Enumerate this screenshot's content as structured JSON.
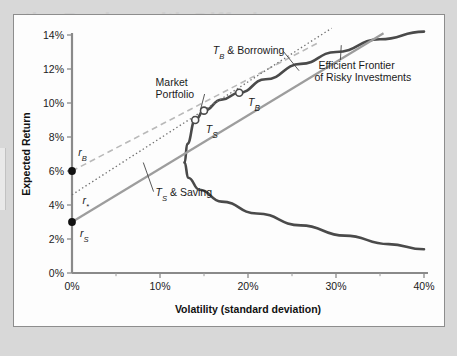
{
  "figure": {
    "background_color": "#fdfdfd",
    "page_background": "#d8d8d8",
    "border_color": "#8d8d8d",
    "ghost_text": {
      "title": "the Banker with Differing",
      "line1": "Volatility problem and",
      "line2": "a possible solution"
    }
  },
  "chart_data": {
    "type": "line",
    "title": "",
    "xlabel": "Volatility (standard deviation)",
    "ylabel": "Expected Return",
    "xlim": [
      0,
      40
    ],
    "ylim": [
      0,
      14
    ],
    "grid": false,
    "legend_position": "inline-annotations",
    "xticks": [
      0,
      10,
      20,
      30,
      40
    ],
    "xtick_labels": [
      "0%",
      "10%",
      "20%",
      "30%",
      "40%"
    ],
    "yticks": [
      0,
      2,
      4,
      6,
      8,
      10,
      12,
      14
    ],
    "ytick_labels": [
      "0%",
      "2%",
      "4%",
      "6%",
      "8%",
      "10%",
      "12%",
      "14%"
    ],
    "series": [
      {
        "name": "Efficient Frontier of Risky Investments",
        "style": "solid",
        "color": "#4a4a4a",
        "width": 2.6,
        "note": "hyperbola; upper efficient branch and lower inefficient branch",
        "min_variance_point": {
          "x": 12.8,
          "y": 6.5
        },
        "points_upper": [
          {
            "x": 12.8,
            "y": 6.5
          },
          {
            "x": 13.1,
            "y": 7.6
          },
          {
            "x": 14.0,
            "y": 9.0
          },
          {
            "x": 15.0,
            "y": 9.55
          },
          {
            "x": 17.0,
            "y": 10.2
          },
          {
            "x": 19.0,
            "y": 10.6
          },
          {
            "x": 22.0,
            "y": 11.4
          },
          {
            "x": 26.0,
            "y": 12.3
          },
          {
            "x": 30.0,
            "y": 13.0
          },
          {
            "x": 35.0,
            "y": 13.75
          },
          {
            "x": 40.0,
            "y": 14.2
          }
        ],
        "points_lower": [
          {
            "x": 12.8,
            "y": 6.5
          },
          {
            "x": 13.2,
            "y": 5.6
          },
          {
            "x": 14.5,
            "y": 4.9
          },
          {
            "x": 17.0,
            "y": 4.2
          },
          {
            "x": 21.0,
            "y": 3.5
          },
          {
            "x": 26.0,
            "y": 2.8
          },
          {
            "x": 31.0,
            "y": 2.2
          },
          {
            "x": 36.0,
            "y": 1.7
          },
          {
            "x": 40.0,
            "y": 1.4
          }
        ]
      },
      {
        "name": "T_B & Borrowing",
        "style": "dashed",
        "color": "#b9b9b9",
        "width": 1.6,
        "intercept": {
          "x": 0,
          "y": 6.0
        },
        "tangency": {
          "x": 19.0,
          "y": 10.6
        },
        "end": {
          "x": 28.2,
          "y": 13.6
        },
        "slope_per_pct_vol": 0.242
      },
      {
        "name": "T_S & Saving",
        "style": "solid",
        "color": "#9d9d9d",
        "width": 2.2,
        "intercept": {
          "x": 0,
          "y": 3.0
        },
        "tangency": {
          "x": 14.0,
          "y": 9.0
        },
        "end": {
          "x": 35.4,
          "y": 14.1
        },
        "slope_per_pct_vol": 0.4286
      },
      {
        "name": "r* tangent through Market Portfolio",
        "style": "dotted",
        "color": "#6f6f6f",
        "width": 1.3,
        "intercept": {
          "x": 0,
          "y": 4.6
        },
        "tangency": {
          "x": 15.0,
          "y": 9.55
        },
        "end": {
          "x": 29.5,
          "y": 14.4
        },
        "slope_per_pct_vol": 0.33
      }
    ],
    "points": [
      {
        "label": "r_B",
        "x": 0,
        "y": 6.0,
        "marker": "filled-circle",
        "color": "#111111"
      },
      {
        "label": "r_S",
        "x": 0,
        "y": 3.0,
        "marker": "filled-circle",
        "color": "#111111"
      },
      {
        "label": "T_S",
        "x": 14.0,
        "y": 9.0,
        "marker": "open-circle",
        "color": "#4a4a4a"
      },
      {
        "label": "Market Portfolio",
        "x": 15.0,
        "y": 9.55,
        "marker": "open-circle",
        "color": "#4a4a4a"
      },
      {
        "label": "T_B",
        "x": 19.0,
        "y": 10.6,
        "marker": "open-circle",
        "color": "#4a4a4a"
      }
    ],
    "annotations": [
      {
        "id": "tb-borrowing",
        "text_main": "T",
        "text_sub": "B",
        "text_rest": " & Borrowing",
        "x": 16.0,
        "y": 12.9,
        "leader_to": {
          "x": 25.8,
          "y": 11.9
        }
      },
      {
        "id": "market-portfolio",
        "line1": "Market",
        "line2": "Portfolio",
        "x": 9.5,
        "y": 11.0,
        "leader_to": {
          "x": 14.6,
          "y": 9.6
        }
      },
      {
        "id": "efficient-frontier",
        "line1": "Efficient Frontier",
        "line2": "of Risky Investments",
        "x": 28.0,
        "y": 12.0,
        "leader_to": {
          "x": 30.6,
          "y": 13.4
        }
      },
      {
        "id": "ts-saving",
        "text_main": "T",
        "text_sub": "S",
        "text_rest": " & Saving",
        "x": 9.5,
        "y": 4.55,
        "leader_to": {
          "x": 8.1,
          "y": 6.5
        }
      },
      {
        "id": "rb-label",
        "text_main": "r",
        "text_sub": "B",
        "x": 0.7,
        "y": 6.9
      },
      {
        "id": "rs-label",
        "text_main": "r",
        "text_sub": "S",
        "x": 0.9,
        "y": 2.1
      },
      {
        "id": "rstar-label",
        "text_main": "r",
        "text_sub": "*",
        "x": 1.2,
        "y": 4.05
      },
      {
        "id": "ts-point-label",
        "text_main": "T",
        "text_sub": "S",
        "x": 15.2,
        "y": 8.25
      },
      {
        "id": "tb-point-label",
        "text_main": "T",
        "text_sub": "B",
        "x": 20.0,
        "y": 9.85
      }
    ]
  }
}
